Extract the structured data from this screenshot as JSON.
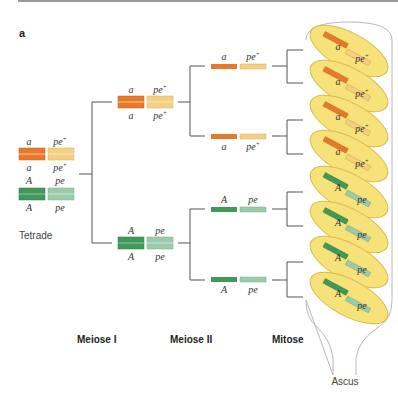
{
  "figure": {
    "panel_letter": "a",
    "colors": {
      "a_allele": "#e8782a",
      "pe_plus_allele": "#f5cf82",
      "A_allele": "#3f9a5a",
      "pe_allele": "#9ccbaa",
      "spore_fill": "#f7e27a",
      "spore_stroke": "#d9b94a",
      "ascus_fill": "#ffffff",
      "ascus_stroke": "#b8b8b8",
      "line": "#555555"
    },
    "labels": {
      "tetrade": "Tetrade",
      "meiose_1": "Meiose I",
      "meiose_2": "Meiose II",
      "mitose": "Mitose",
      "ascus": "Ascus"
    },
    "alleles": {
      "a": "a",
      "A": "A",
      "pe": "pe",
      "plus": "+"
    },
    "tetrade": {
      "top_pair": [
        "a",
        "pe+"
      ],
      "bottom_pair": [
        "A",
        "pe"
      ]
    },
    "meiose_1_products": [
      {
        "locus1": "a",
        "locus2": "pe+"
      },
      {
        "locus1": "A",
        "locus2": "pe"
      }
    ],
    "meiose_2_products": [
      {
        "locus1": "a",
        "locus2": "pe+"
      },
      {
        "locus1": "a",
        "locus2": "pe+"
      },
      {
        "locus1": "A",
        "locus2": "pe"
      },
      {
        "locus1": "A",
        "locus2": "pe"
      }
    ],
    "ascospores": [
      {
        "locus1": "a",
        "locus2": "pe+"
      },
      {
        "locus1": "a",
        "locus2": "pe+"
      },
      {
        "locus1": "a",
        "locus2": "pe+"
      },
      {
        "locus1": "a",
        "locus2": "pe+"
      },
      {
        "locus1": "A",
        "locus2": "pe"
      },
      {
        "locus1": "A",
        "locus2": "pe"
      },
      {
        "locus1": "A",
        "locus2": "pe"
      },
      {
        "locus1": "A",
        "locus2": "pe"
      }
    ]
  }
}
